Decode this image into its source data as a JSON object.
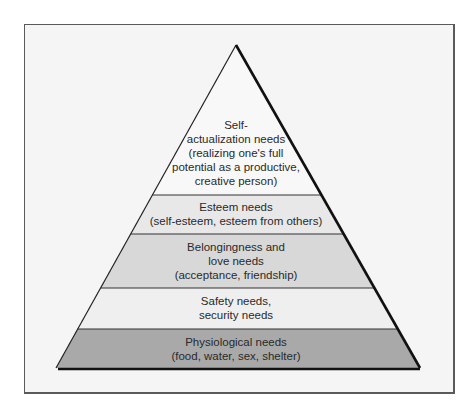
{
  "diagram": {
    "type": "pyramid",
    "colors": {
      "frame_bg": "#f5f5f5",
      "outline": "#111111",
      "level_self_actualization": "#f8f8f8",
      "level_esteem": "#e8e8e8",
      "level_belongingness": "#d8d8d8",
      "level_safety": "#efefef",
      "level_physiological": "#a9a9a9"
    },
    "levels": [
      {
        "id": "self-actualization",
        "lines": [
          "Self-",
          "actualization needs",
          "(realizing one's full",
          "potential as a productive,",
          "creative person)"
        ]
      },
      {
        "id": "esteem",
        "lines": [
          "Esteem needs",
          "(self-esteem, esteem from others)"
        ]
      },
      {
        "id": "belongingness",
        "lines": [
          "Belongingness and",
          "love needs",
          "(acceptance, friendship)"
        ]
      },
      {
        "id": "safety",
        "lines": [
          "Safety needs,",
          "security needs"
        ]
      },
      {
        "id": "physiological",
        "lines": [
          "Physiological needs",
          "(food, water, sex, shelter)"
        ]
      }
    ]
  }
}
